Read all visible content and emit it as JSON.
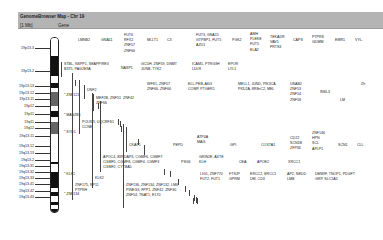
{
  "window": {
    "title": "GenomeBrowser Map - Chr 19",
    "col1": "[1 Mb]",
    "col2": "Gene"
  },
  "ideogram": {
    "bands": [
      {
        "top": 0,
        "h": 18,
        "color": "#ffffff"
      },
      {
        "top": 18,
        "h": 20,
        "color": "#111111"
      },
      {
        "top": 38,
        "h": 7,
        "color": "#ffffff"
      },
      {
        "top": 45,
        "h": 5,
        "color": "#111111"
      },
      {
        "top": 50,
        "h": 4,
        "color": "#ffffff"
      },
      {
        "top": 54,
        "h": 14,
        "color": "#666666"
      },
      {
        "top": 68,
        "h": 5,
        "color": "#ffffff"
      },
      {
        "top": 73,
        "h": 6,
        "color": "#111111"
      },
      {
        "top": 79,
        "h": 5,
        "color": "#ffffff"
      },
      {
        "top": 84,
        "h": 12,
        "color": "#666666"
      },
      {
        "top": 96,
        "h": 28,
        "color": "#ffffff"
      },
      {
        "top": 124,
        "h": 2,
        "color": "#111111"
      },
      {
        "top": 126,
        "h": 8,
        "color": "#ffffff"
      },
      {
        "top": 134,
        "h": 16,
        "color": "#111111"
      },
      {
        "top": 150,
        "h": 4,
        "color": "#ffffff"
      },
      {
        "top": 154,
        "h": 4,
        "color": "#111111"
      },
      {
        "top": 158,
        "h": 6,
        "color": "#ffffff"
      },
      {
        "top": 164,
        "h": 3,
        "color": "#111111"
      },
      {
        "top": 167,
        "h": 4,
        "color": "#ffffff"
      },
      {
        "top": 171,
        "h": 5,
        "color": "#111111"
      }
    ],
    "labels": [
      {
        "text": "19p13.3",
        "y": 48
      },
      {
        "text": "19p13.2",
        "y": 71
      },
      {
        "text": "19p13.13",
        "y": 86
      },
      {
        "text": "19p13.12",
        "y": 93
      },
      {
        "text": "19p13.11",
        "y": 99
      },
      {
        "text": "19p12",
        "y": 106
      },
      {
        "text": "19p11",
        "y": 114
      },
      {
        "text": "19q11",
        "y": 122
      },
      {
        "text": "19q12",
        "y": 128
      },
      {
        "text": "19q13.11",
        "y": 136
      },
      {
        "text": "19q13.12",
        "y": 146
      },
      {
        "text": "19q13.13",
        "y": 153
      },
      {
        "text": "19q13.2",
        "y": 160
      },
      {
        "text": "19q13.31",
        "y": 166
      },
      {
        "text": "19q13.32",
        "y": 172
      },
      {
        "text": "19q13.33",
        "y": 178
      },
      {
        "text": "19q13.41",
        "y": 184
      },
      {
        "text": "19q13.42",
        "y": 191
      },
      {
        "text": "19q13.43",
        "y": 197
      }
    ]
  },
  "markers": [
    {
      "text": "ZNF121",
      "x": 64,
      "y": 95
    },
    {
      "text": "MAN2B1",
      "x": 64,
      "y": 115
    },
    {
      "text": "SYD1",
      "x": 64,
      "y": 132
    },
    {
      "text": "KLK1",
      "x": 64,
      "y": 174
    },
    {
      "text": "ZNF134",
      "x": 64,
      "y": 194
    }
  ],
  "genes": [
    {
      "x": 78,
      "y": 38,
      "bar": [
        80,
        52
      ],
      "lines": [
        "LMNB2"
      ]
    },
    {
      "x": 101,
      "y": 38,
      "bar": [
        103,
        52
      ],
      "lines": [
        "GNA11"
      ]
    },
    {
      "x": 124,
      "y": 33,
      "bar": [
        126,
        57
      ],
      "lines": [
        "FUT6",
        "RFX2",
        "ZNF57",
        "ZNF66"
      ]
    },
    {
      "x": 147,
      "y": 38,
      "bar": [
        149,
        52
      ],
      "lines": [
        "MLLT1"
      ]
    },
    {
      "x": 167,
      "y": 38,
      "bar": [
        169,
        52
      ],
      "lines": [
        "C3"
      ]
    },
    {
      "x": 196,
      "y": 33,
      "bar": [
        198,
        57
      ],
      "lines": [
        "FUT3, GNA15",
        "GTPBP1, FUT5",
        "AZU1"
      ]
    },
    {
      "x": 232,
      "y": 38,
      "bar": [
        234,
        52
      ],
      "lines": [
        "PGK2"
      ]
    },
    {
      "x": 250,
      "y": 32,
      "bar": [
        252,
        57
      ],
      "lines": [
        "AMH",
        "PLEKE",
        "FUT5",
        "ELA2"
      ]
    },
    {
      "x": 270,
      "y": 35,
      "bar": [
        272,
        53
      ],
      "lines": [
        "TEKADR",
        "VAV1",
        "FRTS3"
      ]
    },
    {
      "x": 293,
      "y": 38,
      "bar": [
        295,
        55
      ],
      "lines": [
        "CAPS"
      ]
    },
    {
      "x": 312,
      "y": 35,
      "bar": [
        314,
        55
      ],
      "lines": [
        "PTPRS",
        "GDMM"
      ]
    },
    {
      "x": 335,
      "y": 38,
      "bar": [
        337,
        55
      ],
      "lines": [
        "EMR1"
      ]
    },
    {
      "x": 355,
      "y": 38,
      "bar": [
        357,
        55
      ],
      "lines": [
        "VYL-"
      ]
    },
    {
      "x": 64,
      "y": 62,
      "bar": [
        62,
        77
      ],
      "lines": [
        "STBL, NSPP1, SEAPP/RE3",
        "B3T5, PAG2E3A"
      ]
    },
    {
      "x": 121,
      "y": 66,
      "bar": [
        119,
        76
      ],
      "lines": [
        "NASP1"
      ]
    },
    {
      "x": 141,
      "y": 62,
      "bar": [
        139,
        78
      ],
      "lines": [
        "GCDH, ZNF59, DNMT",
        "JUNB, TYK2"
      ]
    },
    {
      "x": 192,
      "y": 62,
      "bar": [
        190,
        74
      ],
      "lines": [
        "ICAM1, PTRG3H",
        "LDLR"
      ]
    },
    {
      "x": 228,
      "y": 62,
      "bar": [
        226,
        74
      ],
      "lines": [
        "EPOR",
        "LYL1"
      ]
    },
    {
      "x": 87,
      "y": 88,
      "bar": [
        85,
        99
      ],
      "lines": [
        "DNF2"
      ]
    },
    {
      "x": 96,
      "y": 96,
      "bar": [
        94,
        111
      ],
      "lines": [
        "MEF2B, ZNF51",
        "ZNF66"
      ]
    },
    {
      "x": 147,
      "y": 82,
      "bar": [
        145,
        93
      ],
      "lines": [
        "WFS1, ZNF57",
        "ZNF66, ZNF66"
      ]
    },
    {
      "x": 188,
      "y": 82,
      "bar": [
        186,
        93
      ],
      "lines": [
        "ELL-PEB, AKG",
        "COMP, PTGER1"
      ]
    },
    {
      "x": 238,
      "y": 82,
      "bar": [
        236,
        93
      ],
      "lines": [
        "MELL1, JUND, PIK3CA",
        "PKD2A, 8R8nC2, MEL"
      ]
    },
    {
      "x": 290,
      "y": 82,
      "bar": [
        288,
        104
      ],
      "lines": [
        "USAB2",
        "ZNF53",
        "ZNF54",
        "ZNF58"
      ]
    },
    {
      "x": 320,
      "y": 90,
      "bar": [
        318,
        104
      ],
      "lines": [
        "INSL3"
      ]
    },
    {
      "x": 340,
      "y": 98,
      "bar": [
        338,
        110
      ],
      "lines": [
        "LM"
      ]
    },
    {
      "x": 361,
      "y": 82,
      "bar": [
        359,
        95
      ],
      "lines": [
        "Zh"
      ]
    },
    {
      "x": 123,
      "y": 96,
      "bar": [
        121,
        104
      ],
      "lines": [
        "ZNF42"
      ]
    },
    {
      "x": 82,
      "y": 120,
      "bar": [
        80,
        134
      ],
      "lines": [
        "POLR2I, UQCRFS1",
        "CCNE"
      ]
    },
    {
      "x": 129,
      "y": 143,
      "bar": [
        127,
        152
      ],
      "lines": [
        "CKAP1"
      ]
    },
    {
      "x": 173,
      "y": 143,
      "bar": [
        171,
        152
      ],
      "lines": [
        "PEPD"
      ]
    },
    {
      "x": 197,
      "y": 135,
      "bar": [
        195,
        150
      ],
      "lines": [
        "ATP4A",
        "MAG"
      ]
    },
    {
      "x": 230,
      "y": 143,
      "bar": [
        228,
        152
      ],
      "lines": [
        "GPI"
      ]
    },
    {
      "x": 261,
      "y": 143,
      "bar": [
        259,
        152
      ],
      "lines": [
        "COX7A1"
      ]
    },
    {
      "x": 290,
      "y": 136,
      "bar": [
        288,
        153
      ],
      "lines": [
        "CD22",
        "SCN1B",
        "ZFP36"
      ]
    },
    {
      "x": 312,
      "y": 131,
      "bar": [
        310,
        155
      ],
      "lines": [
        "ZNF146",
        "HPN",
        "SCL",
        "APLP1"
      ]
    },
    {
      "x": 338,
      "y": 143,
      "bar": [
        336,
        154
      ],
      "lines": [
        "SCN1"
      ]
    },
    {
      "x": 357,
      "y": 143,
      "bar": [
        355,
        154
      ],
      "lines": [
        "CLL"
      ]
    },
    {
      "x": 103,
      "y": 155,
      "bar": [
        101,
        172
      ],
      "lines": [
        "APOC4, B3PDAP3, CGMF6, CGMF7",
        "CGMF5, CGMF8, CGMF4, CGMF3",
        "CGMF2, CYTBA5"
      ]
    },
    {
      "x": 181,
      "y": 160,
      "bar": [
        179,
        172
      ],
      "lines": [
        "PSG6"
      ]
    },
    {
      "x": 199,
      "y": 155,
      "bar": [
        197,
        166
      ],
      "lines": [
        "GRIN2E, AXTE",
        "KLH"
      ]
    },
    {
      "x": 239,
      "y": 160,
      "bar": [
        237,
        172
      ],
      "lines": [
        "CEA"
      ]
    },
    {
      "x": 257,
      "y": 160,
      "bar": [
        255,
        172
      ],
      "lines": [
        "APOE2"
      ]
    },
    {
      "x": 288,
      "y": 160,
      "bar": [
        286,
        172
      ],
      "lines": [
        "XRCC1"
      ]
    },
    {
      "x": 95,
      "y": 176,
      "bar": [
        93,
        188
      ],
      "lines": [
        "KLK2"
      ]
    },
    {
      "x": 200,
      "y": 172,
      "bar": [
        198,
        185
      ],
      "lines": [
        "LIG1, ZNF770",
        "FUT2, FUT1"
      ]
    },
    {
      "x": 229,
      "y": 172,
      "bar": [
        227,
        185
      ],
      "lines": [
        "FTSJP",
        "GPRM"
      ]
    },
    {
      "x": 250,
      "y": 172,
      "bar": [
        248,
        185
      ],
      "lines": [
        "ERCC2, ERCC1",
        "DM, CD3"
      ]
    },
    {
      "x": 287,
      "y": 172,
      "bar": [
        285,
        185
      ],
      "lines": [
        "AP2, NEDD",
        "LMB"
      ]
    },
    {
      "x": 315,
      "y": 172,
      "bar": [
        313,
        185
      ],
      "lines": [
        "DMWIF, TNOP1, PDGFT",
        "GRP, SLC1A5"
      ]
    },
    {
      "x": 75,
      "y": 183,
      "bar": [
        73,
        200
      ],
      "lines": [
        "ZNF175, RP11",
        "PTPRH"
      ]
    },
    {
      "x": 126,
      "y": 183,
      "bar": [
        124,
        208
      ],
      "lines": [
        "ZNF136, ZNF134, ZNF132, LM6",
        "PINEG3, FPP1, ZNF42, ZNF30",
        "ZNF54, TNAT1, E170"
      ]
    }
  ]
}
